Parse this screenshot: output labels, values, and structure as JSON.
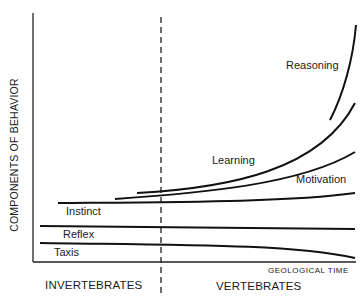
{
  "diagram": {
    "y_axis_label": "COMPONENTS OF BEHAVIOR",
    "x_axis_label": "GEOLOGICAL TIME",
    "groups": {
      "left": "INVERTEBRATES",
      "right": "VERTEBRATES"
    },
    "divider": {
      "style": "dashed",
      "meaning": "boundary between invertebrates and vertebrates"
    },
    "curves": [
      {
        "label": "Reasoning",
        "trend": "steep exponential rise, vertebrates late"
      },
      {
        "label": "Learning",
        "trend": "exponential rise, begins near divider"
      },
      {
        "label": "Motivation",
        "trend": "moderate rise, begins in invertebrates"
      },
      {
        "label": "Instinct",
        "trend": "nearly flat, slight rise"
      },
      {
        "label": "Reflex",
        "trend": "flat"
      },
      {
        "label": "Taxis",
        "trend": "flat then declining"
      }
    ],
    "colors": {
      "line": "#111111",
      "text": "#1a1a1a",
      "background": "#ffffff"
    }
  }
}
